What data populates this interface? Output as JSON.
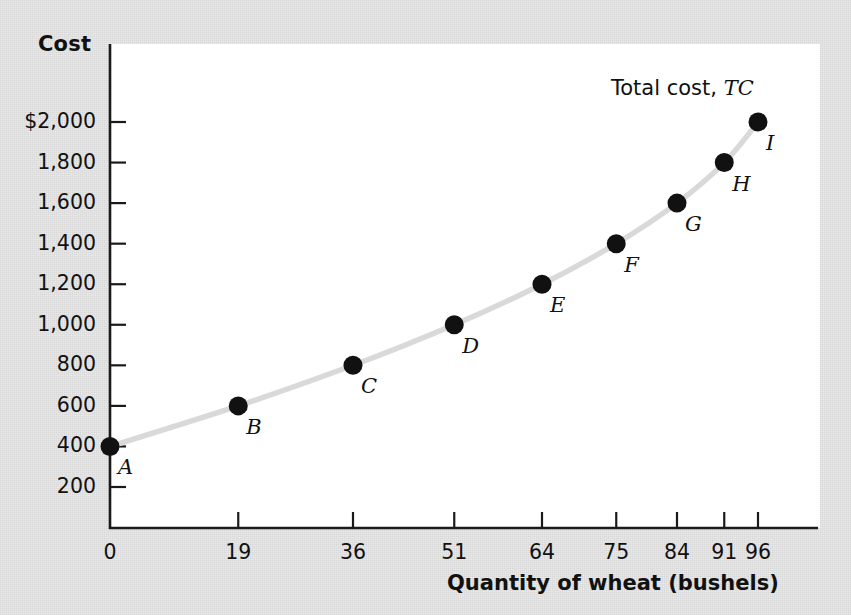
{
  "chart_data": {
    "type": "line",
    "title": "",
    "xlabel": "Quantity of wheat (bushels)",
    "ylabel": "Cost",
    "series_label": "Total cost,",
    "series_symbol": "TC",
    "xlim": [
      0,
      103
    ],
    "ylim": [
      0,
      2130
    ],
    "grid": false,
    "legend_position": "inside-top-right",
    "x_ticks": [
      "0",
      "19",
      "36",
      "51",
      "64",
      "75",
      "84",
      "91",
      "96"
    ],
    "x_tick_values": [
      0,
      19,
      36,
      51,
      64,
      75,
      84,
      91,
      96
    ],
    "y_ticks": [
      "200",
      "400",
      "600",
      "800",
      "1,000",
      "1,200",
      "1,400",
      "1,600",
      "1,800",
      "$2,000"
    ],
    "y_tick_values": [
      200,
      400,
      600,
      800,
      1000,
      1200,
      1400,
      1600,
      1800,
      2000
    ],
    "point_labels": [
      "A",
      "B",
      "C",
      "D",
      "E",
      "F",
      "G",
      "H",
      "I"
    ],
    "x": [
      0,
      19,
      36,
      51,
      64,
      75,
      84,
      91,
      96
    ],
    "values": [
      400,
      600,
      800,
      1000,
      1200,
      1400,
      1600,
      1800,
      2000
    ],
    "points": [
      {
        "label": "A",
        "x": 0,
        "y": 400
      },
      {
        "label": "B",
        "x": 19,
        "y": 600
      },
      {
        "label": "C",
        "x": 36,
        "y": 800
      },
      {
        "label": "D",
        "x": 51,
        "y": 1000
      },
      {
        "label": "E",
        "x": 64,
        "y": 1200
      },
      {
        "label": "F",
        "x": 75,
        "y": 1400
      },
      {
        "label": "G",
        "x": 84,
        "y": 1600
      },
      {
        "label": "H",
        "x": 91,
        "y": 1800
      },
      {
        "label": "I",
        "x": 96,
        "y": 2000
      }
    ],
    "colors": {
      "curve": "#d9d9d9",
      "point": "#111111",
      "axis": "#1a1a1a",
      "panel_background": "#ffffff",
      "page_background": "#e9e9e9"
    }
  }
}
